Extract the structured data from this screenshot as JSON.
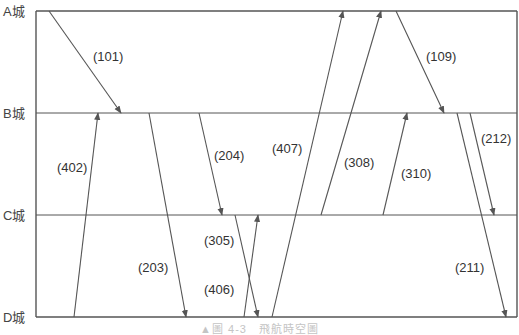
{
  "diagram": {
    "type": "time-space diagram",
    "caption": "▲圖 4-3　飛航時空圖",
    "colors": {
      "line": "#555555",
      "frame": "#555555",
      "text": "#333333"
    },
    "frame": {
      "x_left": 36,
      "x_right": 517
    },
    "cities": [
      {
        "label": "A城",
        "y": 11
      },
      {
        "label": "B城",
        "y": 113
      },
      {
        "label": "C城",
        "y": 215
      },
      {
        "label": "D城",
        "y": 317
      }
    ],
    "flights": [
      {
        "id": "(101)",
        "from": "A城",
        "to": "B城",
        "x1": 49,
        "y1": 11,
        "x2": 121,
        "y2": 113,
        "label_x": 93,
        "label_y": 61
      },
      {
        "id": "(402)",
        "from": "D城",
        "to": "B城",
        "x1": 74,
        "y1": 317,
        "x2": 98,
        "y2": 113,
        "label_x": 57,
        "label_y": 172
      },
      {
        "id": "(203)",
        "from": "B城",
        "to": "D城",
        "x1": 149,
        "y1": 113,
        "x2": 186,
        "y2": 317,
        "label_x": 138,
        "label_y": 272
      },
      {
        "id": "(204)",
        "from": "B城",
        "to": "C城",
        "x1": 199,
        "y1": 113,
        "x2": 222,
        "y2": 215,
        "label_x": 214,
        "label_y": 160
      },
      {
        "id": "(305)",
        "from": "C城",
        "to": "D城",
        "x1": 235,
        "y1": 215,
        "x2": 258,
        "y2": 317,
        "label_x": 204,
        "label_y": 245
      },
      {
        "id": "(406)",
        "from": "D城",
        "to": "C城",
        "x1": 244,
        "y1": 317,
        "x2": 258,
        "y2": 215,
        "label_x": 204,
        "label_y": 294
      },
      {
        "id": "(407)",
        "from": "D城",
        "to": "A城",
        "x1": 272,
        "y1": 317,
        "x2": 343,
        "y2": 11,
        "label_x": 272,
        "label_y": 153
      },
      {
        "id": "(308)",
        "from": "C城",
        "to": "A城",
        "x1": 321,
        "y1": 215,
        "x2": 381,
        "y2": 11,
        "label_x": 344,
        "label_y": 167
      },
      {
        "id": "(310)",
        "from": "C城",
        "to": "B城",
        "x1": 383,
        "y1": 215,
        "x2": 407,
        "y2": 113,
        "label_x": 401,
        "label_y": 178
      },
      {
        "id": "(109)",
        "from": "A城",
        "to": "B城",
        "x1": 396,
        "y1": 11,
        "x2": 444,
        "y2": 113,
        "label_x": 426,
        "label_y": 61
      },
      {
        "id": "(212)",
        "from": "B城",
        "to": "C城",
        "x1": 470,
        "y1": 113,
        "x2": 494,
        "y2": 215,
        "label_x": 481,
        "label_y": 143
      },
      {
        "id": "(211)",
        "from": "B城",
        "to": "D城",
        "x1": 457,
        "y1": 113,
        "x2": 506,
        "y2": 317,
        "label_x": 455,
        "label_y": 272
      }
    ]
  }
}
